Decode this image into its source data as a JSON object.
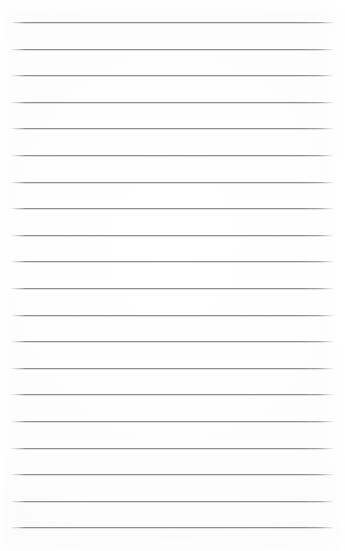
{
  "document": {
    "kind": "lined-paper",
    "title": "Blank ruled notepad page",
    "text_content": "",
    "handwriting": "",
    "page_width": 345,
    "page_height": 551
  },
  "paper": {
    "background_color": "#fdfdfd",
    "edge_tint_color": "#f7f7f6"
  },
  "rules": {
    "count": 20,
    "line_color": "#8e9096",
    "line_thickness": 1,
    "left_x": 11,
    "right_x": 334,
    "first_y": 22,
    "spacing": 26.6,
    "positions_y": [
      22,
      48.6,
      75.2,
      101.8,
      128.4,
      155,
      181.6,
      208.2,
      234.8,
      261.4,
      288,
      314.6,
      341.2,
      367.8,
      394.4,
      421,
      447.6,
      474.2,
      500.8,
      527.4
    ]
  }
}
